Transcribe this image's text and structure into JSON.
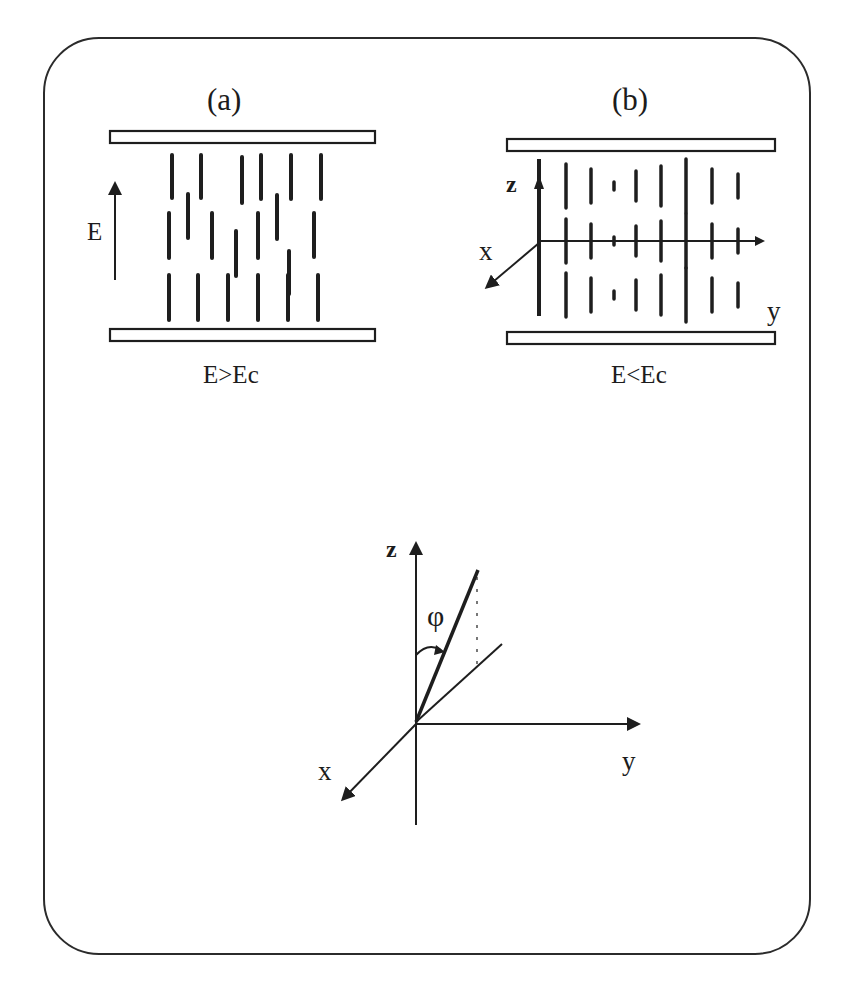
{
  "figure": {
    "panel_a": {
      "title": "(a)",
      "field_label": "E",
      "condition": "E>Ec",
      "plates": [
        {
          "x": 110,
          "y": 131,
          "w": 265,
          "h": 12
        },
        {
          "x": 110,
          "y": 329,
          "w": 265,
          "h": 12
        }
      ],
      "field_arrow": {
        "x": 115,
        "y1": 280,
        "y2": 178
      },
      "molecules": [
        {
          "x": 172,
          "y1": 155,
          "y2": 198
        },
        {
          "x": 201,
          "y1": 155,
          "y2": 198
        },
        {
          "x": 242,
          "y1": 157,
          "y2": 203
        },
        {
          "x": 261,
          "y1": 155,
          "y2": 199
        },
        {
          "x": 291,
          "y1": 155,
          "y2": 199
        },
        {
          "x": 321,
          "y1": 155,
          "y2": 199
        },
        {
          "x": 169,
          "y1": 213,
          "y2": 258
        },
        {
          "x": 188,
          "y1": 194,
          "y2": 238
        },
        {
          "x": 212,
          "y1": 213,
          "y2": 258
        },
        {
          "x": 236,
          "y1": 231,
          "y2": 276
        },
        {
          "x": 258,
          "y1": 213,
          "y2": 258
        },
        {
          "x": 277,
          "y1": 195,
          "y2": 239
        },
        {
          "x": 289,
          "y1": 251,
          "y2": 294
        },
        {
          "x": 314,
          "y1": 213,
          "y2": 257
        },
        {
          "x": 169,
          "y1": 275,
          "y2": 320
        },
        {
          "x": 198,
          "y1": 275,
          "y2": 320
        },
        {
          "x": 228,
          "y1": 275,
          "y2": 320
        },
        {
          "x": 258,
          "y1": 275,
          "y2": 320
        },
        {
          "x": 288,
          "y1": 275,
          "y2": 320
        },
        {
          "x": 318,
          "y1": 275,
          "y2": 320
        }
      ]
    },
    "panel_b": {
      "title": "(b)",
      "condition": "E<Ec",
      "axis_labels": {
        "x": "x",
        "y": "y",
        "z": "z"
      },
      "plates": [
        {
          "x": 507,
          "y": 139,
          "w": 268,
          "h": 12
        },
        {
          "x": 507,
          "y": 332,
          "w": 268,
          "h": 12
        }
      ],
      "axes": {
        "origin": [
          539,
          241
        ],
        "z_top": 159,
        "z_bottom": 316,
        "y_end": 763,
        "x_end": [
          487,
          287
        ]
      },
      "columns": [
        {
          "x": 566,
          "half": 22
        },
        {
          "x": 591,
          "half": 17
        },
        {
          "x": 614,
          "half": 4
        },
        {
          "x": 636,
          "half": 15
        },
        {
          "x": 661,
          "half": 20
        },
        {
          "x": 686,
          "half": 27
        },
        {
          "x": 712,
          "half": 17
        },
        {
          "x": 738,
          "half": 12
        }
      ],
      "rows": [
        186,
        241,
        295
      ]
    },
    "orientation": {
      "angle_label": "φ",
      "axis_labels": {
        "x": "x",
        "y": "y",
        "z": "z"
      },
      "origin": [
        416,
        722
      ],
      "z_top": 536,
      "z_bottom": 825,
      "y_end": 642,
      "x_end": [
        338,
        804
      ],
      "director_end": [
        478,
        570
      ],
      "projection_end": [
        502,
        644
      ],
      "dotted_x": 477,
      "dotted_y1": 577,
      "dotted_y2": 665
    },
    "colors": {
      "ink": "#1e1e1e",
      "background": "#ffffff"
    }
  }
}
